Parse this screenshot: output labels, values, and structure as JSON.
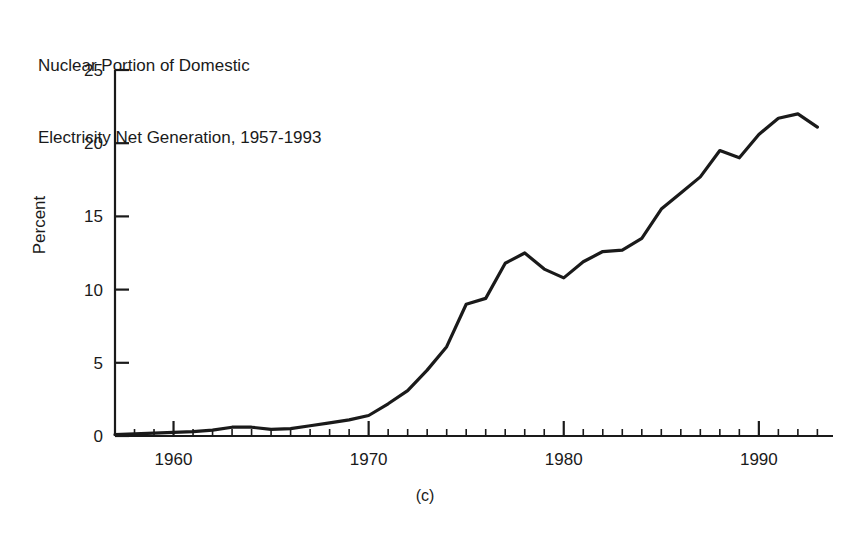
{
  "figure": {
    "title_lines": [
      "Nuclear Portion of Domestic",
      "Electricity Net Generation, 1957-1993"
    ],
    "caption": "(c)",
    "ylabel": "Percent",
    "line_color": "#1a1a1a",
    "axis_color": "#1a1a1a",
    "background": "#ffffff"
  },
  "chart_data": {
    "type": "line",
    "title": "Nuclear Portion of Domestic Electricity Net Generation, 1957-1993",
    "subtitle": "",
    "xlabel": "",
    "ylabel": "Percent",
    "xlim": [
      1957,
      1993.8
    ],
    "ylim": [
      0,
      25
    ],
    "grid": false,
    "legend": null,
    "x_major_ticks": [
      1960,
      1970,
      1980,
      1990
    ],
    "x_major_tick_labels": [
      "1960",
      "1970",
      "1980",
      "1990"
    ],
    "x_minor_tick_step": 1,
    "y_ticks": [
      0,
      5,
      10,
      15,
      20,
      25
    ],
    "y_tick_labels": [
      "0",
      "5",
      "10",
      "15",
      "20",
      "25"
    ],
    "series": [
      {
        "name": "Nuclear share of US electricity net generation",
        "x": [
          1957,
          1958,
          1959,
          1960,
          1961,
          1962,
          1963,
          1964,
          1965,
          1966,
          1967,
          1968,
          1969,
          1970,
          1971,
          1972,
          1973,
          1974,
          1975,
          1976,
          1977,
          1978,
          1979,
          1980,
          1981,
          1982,
          1983,
          1984,
          1985,
          1986,
          1987,
          1988,
          1989,
          1990,
          1991,
          1992,
          1993
        ],
        "values": [
          0.1,
          0.15,
          0.2,
          0.25,
          0.3,
          0.4,
          0.6,
          0.6,
          0.45,
          0.5,
          0.7,
          0.9,
          1.1,
          1.4,
          2.2,
          3.1,
          4.5,
          6.1,
          9.0,
          9.4,
          11.8,
          12.5,
          11.4,
          10.8,
          11.9,
          12.6,
          12.7,
          13.5,
          15.5,
          16.6,
          17.7,
          19.5,
          19.0,
          20.6,
          21.7,
          22.0,
          21.1
        ]
      }
    ]
  }
}
